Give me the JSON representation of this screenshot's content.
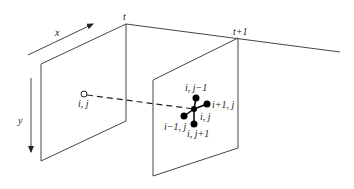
{
  "diagram": {
    "axes": {
      "x_label": "x",
      "y_label": "y"
    },
    "frames": [
      {
        "label": "t"
      },
      {
        "label": "t+1"
      }
    ],
    "source_point": {
      "label": "i, j"
    },
    "neighbors": {
      "center": "i, j",
      "up": "i, j−1",
      "right": "i+1, j",
      "left": "i−1, j",
      "down": "i, j+1"
    },
    "colors": {
      "line": "#444444",
      "dot": "#000000",
      "background": "#ffffff"
    }
  }
}
